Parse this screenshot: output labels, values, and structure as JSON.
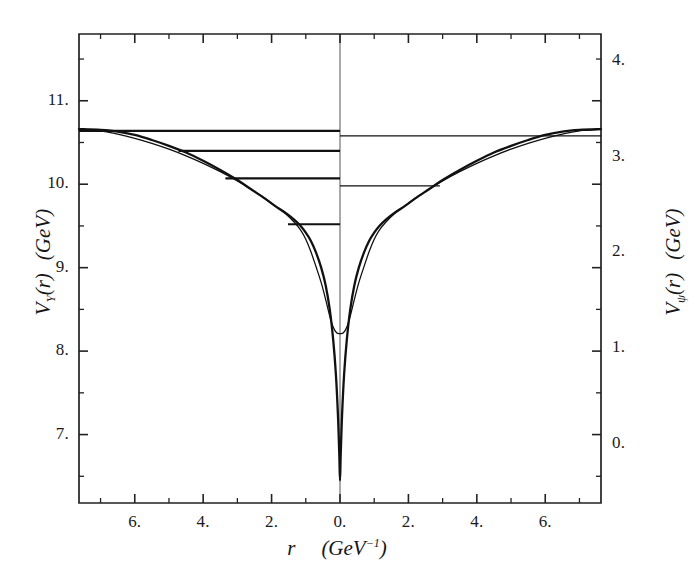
{
  "figure": {
    "background_color": "#ffffff",
    "ink_color": "#111111",
    "plot_frame": {
      "left": 79,
      "top": 34,
      "right": 601,
      "bottom": 503
    }
  },
  "axes": {
    "x": {
      "title_parts": {
        "symbol": "r",
        "units": "(GeV",
        "exponent": "-1",
        "close": ")"
      },
      "title_text": "r  (GeV-1)",
      "tick_labels": [
        "6.",
        "4.",
        "2.",
        "0.",
        "2.",
        "4.",
        "6."
      ],
      "tick_values": [
        -6,
        -4,
        -2,
        0,
        2,
        4,
        6
      ],
      "range": [
        -7.63,
        7.63
      ],
      "minor_step": 1,
      "major_step": 2
    },
    "y_left": {
      "title_parts": {
        "symbol": "V",
        "subscript": "Y",
        "arg": "(r)",
        "units": "(GeV)"
      },
      "title_text": "VY (r)  (GeV)",
      "tick_labels": [
        "11.",
        "10.",
        "9.",
        "8.",
        "7."
      ],
      "tick_values": [
        11,
        10,
        9,
        8,
        7
      ],
      "range": [
        6.18,
        11.8
      ],
      "minor_step": 0.5,
      "major_step": 1
    },
    "y_right": {
      "title_parts": {
        "symbol": "V",
        "subscript": "psi",
        "arg": "(r)",
        "units": "(GeV)"
      },
      "title_text": "Vpsi (r)  (GeV)",
      "tick_labels": [
        "4.",
        "3.",
        "2.",
        "1.",
        "0."
      ],
      "tick_values": [
        4,
        3,
        2,
        1,
        0
      ],
      "range": [
        -0.62,
        4.28
      ],
      "minor_step": 0.5,
      "major_step": 1
    }
  },
  "chart_data": {
    "type": "line",
    "title": "",
    "xlabel": "r  (GeV^-1)",
    "ylabel": "V_Y(r)  (GeV)",
    "ylabel_right": "V_psi(r)  (GeV)",
    "xlim": [
      -7.63,
      7.63
    ],
    "ylim": [
      6.18,
      11.8
    ],
    "ylim_right": [
      -0.62,
      4.28
    ],
    "grid": false,
    "legend": "none",
    "series": [
      {
        "name": "potential-deep",
        "style": "thick",
        "x": [
          -7.63,
          -7.0,
          -6.5,
          -6.0,
          -5.5,
          -5.0,
          -4.5,
          -4.0,
          -3.5,
          -3.0,
          -2.6,
          -2.2,
          -1.9,
          -1.6,
          -1.35,
          -1.15,
          -1.0,
          -0.85,
          -0.7,
          -0.55,
          -0.42,
          -0.3,
          -0.2,
          -0.12,
          -0.06,
          -0.02,
          0.0,
          0.02,
          0.06,
          0.12,
          0.2,
          0.3,
          0.42,
          0.55,
          0.7,
          0.85,
          1.0,
          1.15,
          1.35,
          1.6,
          1.9,
          2.2,
          2.6,
          3.0,
          3.5,
          4.0,
          4.5,
          5.0,
          5.5,
          6.0,
          6.5,
          7.0,
          7.63
        ],
        "y": [
          10.66,
          10.65,
          10.63,
          10.59,
          10.53,
          10.46,
          10.38,
          10.28,
          10.17,
          10.05,
          9.94,
          9.83,
          9.74,
          9.66,
          9.58,
          9.5,
          9.42,
          9.32,
          9.18,
          9.0,
          8.79,
          8.5,
          8.14,
          7.72,
          7.23,
          6.75,
          6.45,
          6.75,
          7.23,
          7.72,
          8.14,
          8.5,
          8.79,
          9.0,
          9.18,
          9.32,
          9.42,
          9.5,
          9.58,
          9.66,
          9.74,
          9.83,
          9.94,
          10.05,
          10.17,
          10.28,
          10.38,
          10.46,
          10.53,
          10.59,
          10.63,
          10.65,
          10.66
        ]
      },
      {
        "name": "potential-shallow",
        "style": "thin",
        "x": [
          -7.63,
          -7.0,
          -6.5,
          -6.0,
          -5.5,
          -5.0,
          -4.5,
          -4.0,
          -3.5,
          -3.0,
          -2.6,
          -2.2,
          -1.9,
          -1.6,
          -1.35,
          -1.15,
          -1.0,
          -0.85,
          -0.7,
          -0.55,
          -0.42,
          -0.3,
          -0.2,
          -0.1,
          0.0,
          0.1,
          0.2,
          0.3,
          0.42,
          0.55,
          0.7,
          0.85,
          1.0,
          1.15,
          1.35,
          1.6,
          1.9,
          2.2,
          2.6,
          3.0,
          3.5,
          4.0,
          4.5,
          5.0,
          5.5,
          6.0,
          6.5,
          7.0,
          7.63
        ],
        "y": [
          10.66,
          10.64,
          10.6,
          10.55,
          10.49,
          10.42,
          10.34,
          10.25,
          10.15,
          10.04,
          9.94,
          9.83,
          9.74,
          9.65,
          9.55,
          9.45,
          9.34,
          9.19,
          9.01,
          8.82,
          8.62,
          8.42,
          8.29,
          8.22,
          8.21,
          8.22,
          8.29,
          8.42,
          8.62,
          8.82,
          9.01,
          9.19,
          9.34,
          9.45,
          9.55,
          9.65,
          9.74,
          9.83,
          9.94,
          10.04,
          10.15,
          10.25,
          10.34,
          10.42,
          10.49,
          10.55,
          10.6,
          10.64,
          10.66
        ]
      }
    ],
    "energy_levels_left": [
      {
        "label": "Y(1S)",
        "value": 10.64,
        "x_start": -7.63,
        "x_end": 0.0
      },
      {
        "label": "Y(2S)",
        "value": 10.4,
        "x_start": -4.72,
        "x_end": 0.0
      },
      {
        "label": "Y(3S)",
        "value": 10.07,
        "x_start": -3.35,
        "x_end": 0.0
      },
      {
        "label": "Y(4S)",
        "value": 9.52,
        "x_start": -1.52,
        "x_end": 0.0
      }
    ],
    "energy_levels_right": [
      {
        "label": "psi(1S)",
        "value": 10.58,
        "x_start": 0.0,
        "x_end": 7.63
      },
      {
        "label": "psi(2S)",
        "value": 9.98,
        "x_start": 0.0,
        "x_end": 2.92
      }
    ]
  }
}
